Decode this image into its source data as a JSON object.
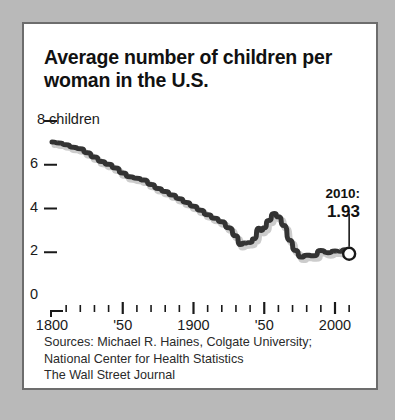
{
  "figure": {
    "title": "Average number of children per woman in the U.S.",
    "background_color": "#ffffff",
    "frame_color": "#6d6d6d",
    "line_color": "#333333",
    "page_color": "#b9b9b9"
  },
  "annotation": {
    "year_label": "2010:",
    "value_label": "1.93",
    "marker": "end-point-circle"
  },
  "sources": {
    "line1": "Sources: Michael R. Haines, Colgate University;",
    "line2": "National Center for Health Statistics",
    "line3": "The Wall Street Journal"
  },
  "axes": {
    "y_ticks": [
      {
        "value": 8,
        "label": "8 children"
      },
      {
        "value": 6,
        "label": "6"
      },
      {
        "value": 4,
        "label": "4"
      },
      {
        "value": 2,
        "label": "2"
      },
      {
        "value": 0,
        "label": "0"
      }
    ],
    "x_major_ticks": [
      {
        "value": 1800,
        "label": "1800"
      },
      {
        "value": 1850,
        "label": "'50"
      },
      {
        "value": 1900,
        "label": "1900"
      },
      {
        "value": 1950,
        "label": "'50"
      },
      {
        "value": 2000,
        "label": "2000"
      }
    ],
    "x_minor_step": 10
  },
  "chart_data": {
    "type": "line",
    "title": "Average number of children per woman in the U.S.",
    "xlabel": "",
    "ylabel": "8 children",
    "xlim": [
      1800,
      2014
    ],
    "ylim": [
      0,
      8
    ],
    "grid": false,
    "legend": null,
    "series": [
      {
        "name": "Total fertility rate",
        "x": [
          1800,
          1805,
          1810,
          1815,
          1820,
          1825,
          1830,
          1835,
          1840,
          1845,
          1850,
          1855,
          1860,
          1865,
          1870,
          1875,
          1880,
          1885,
          1890,
          1895,
          1900,
          1905,
          1910,
          1915,
          1920,
          1925,
          1930,
          1933,
          1936,
          1940,
          1943,
          1946,
          1948,
          1950,
          1953,
          1957,
          1960,
          1964,
          1968,
          1972,
          1976,
          1980,
          1985,
          1990,
          1995,
          2000,
          2004,
          2007,
          2009,
          2010
        ],
        "values": [
          7.04,
          7.0,
          6.92,
          6.8,
          6.73,
          6.55,
          6.35,
          6.15,
          6.02,
          5.85,
          5.62,
          5.45,
          5.38,
          5.3,
          5.1,
          4.92,
          4.78,
          4.62,
          4.45,
          4.28,
          4.1,
          3.92,
          3.72,
          3.56,
          3.4,
          3.12,
          2.75,
          2.35,
          2.42,
          2.45,
          2.62,
          3.1,
          3.0,
          3.12,
          3.45,
          3.77,
          3.62,
          3.22,
          2.55,
          2.08,
          1.78,
          1.86,
          1.84,
          2.08,
          1.98,
          2.06,
          2.05,
          2.12,
          1.98,
          1.93
        ]
      }
    ],
    "annotations": [
      {
        "x": 2010,
        "y": 1.93,
        "text": "2010:\n1.93"
      }
    ]
  }
}
